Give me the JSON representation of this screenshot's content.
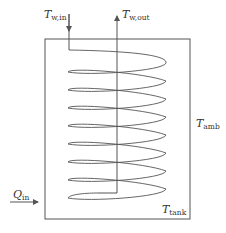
{
  "diagram": {
    "type": "coil-heat-exchanger-tank",
    "colors": {
      "line": "#555555",
      "text": "#333333",
      "background": "#ffffff"
    },
    "coil_turns": 8,
    "labels": {
      "water_inlet": {
        "main": "T",
        "sub": "w,in"
      },
      "water_outlet": {
        "main": "T",
        "sub": "w,out"
      },
      "ambient": {
        "main": "T",
        "sub": "amb"
      },
      "tank": {
        "main": "T",
        "sub": "tank"
      },
      "heat_input": {
        "main": "Q",
        "sub": "in"
      }
    }
  }
}
